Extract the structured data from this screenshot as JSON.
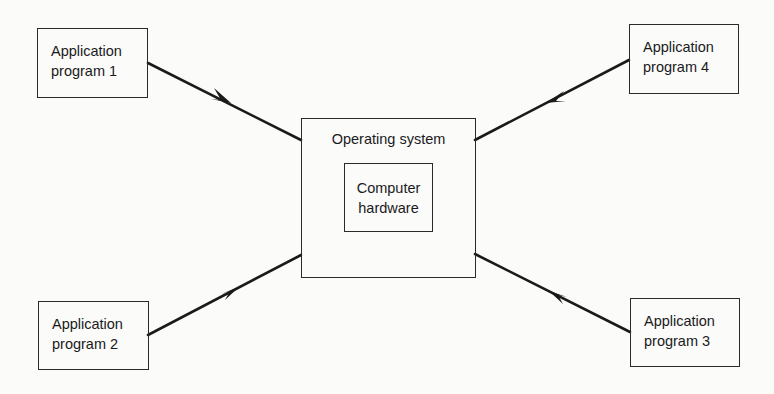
{
  "diagram": {
    "center": {
      "outer_label": "Operating system",
      "inner_label_line1": "Computer",
      "inner_label_line2": "hardware"
    },
    "nodes": [
      {
        "id": "app1",
        "line1": "Application",
        "line2": "program 1"
      },
      {
        "id": "app2",
        "line1": "Application",
        "line2": "program 2"
      },
      {
        "id": "app3",
        "line1": "Application",
        "line2": "program 3"
      },
      {
        "id": "app4",
        "line1": "Application",
        "line2": "program 4"
      }
    ],
    "edges": [
      {
        "from": "Application program 1",
        "to": "Operating system",
        "arrow": "toward operating system"
      },
      {
        "from": "Application program 2",
        "to": "Operating system",
        "arrow": "toward operating system"
      },
      {
        "from": "Application program 3",
        "to": "Operating system",
        "arrow": "toward operating system"
      },
      {
        "from": "Application program 4",
        "to": "Operating system",
        "arrow": "toward operating system"
      }
    ],
    "colors": {
      "line": "#1a1a1a",
      "background": "#fbfbfa"
    }
  }
}
